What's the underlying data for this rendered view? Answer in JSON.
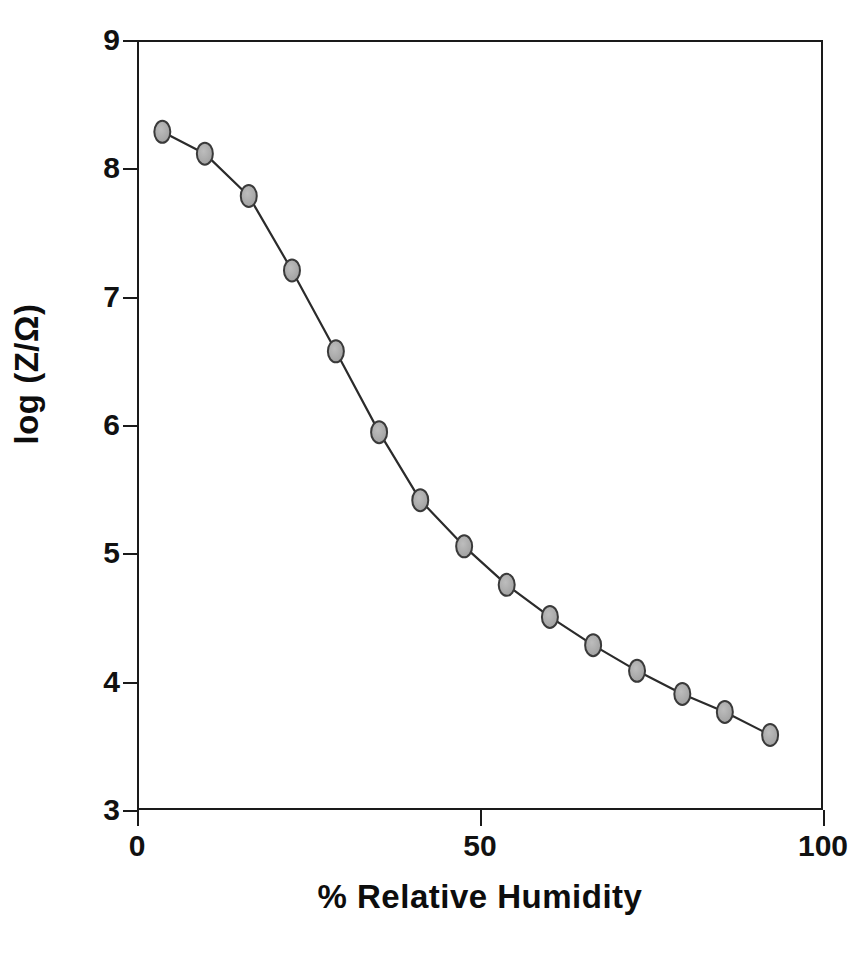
{
  "chart_data": {
    "type": "line",
    "title": "",
    "xlabel": "% Relative Humidity",
    "ylabel": "log (Z/Ω)",
    "xlim": [
      0,
      100
    ],
    "ylim": [
      3,
      9
    ],
    "xticks": [
      0,
      50,
      100
    ],
    "xtick_labels": [
      "0",
      "50",
      "100"
    ],
    "yticks": [
      3,
      4,
      5,
      6,
      7,
      8,
      9
    ],
    "ytick_labels": [
      "3",
      "4",
      "5",
      "6",
      "7",
      "8",
      "9"
    ],
    "grid": false,
    "legend": null,
    "marker": {
      "shape": "ellipse",
      "fill_color": "#a9a9a9",
      "edge_color": "#3a3a3a",
      "width_px": 16,
      "height_px": 22
    },
    "line": {
      "color": "#2b2b2b",
      "width_px": 2.2,
      "style": "solid"
    },
    "series": [
      {
        "name": "log (Z/Ω) vs % Relative Humidity",
        "x": [
          3.4,
          9.6,
          16.0,
          22.3,
          28.7,
          35.0,
          41.0,
          47.4,
          53.6,
          59.9,
          66.2,
          72.6,
          79.2,
          85.4,
          92.0
        ],
        "y": [
          8.3,
          8.13,
          7.8,
          7.22,
          6.59,
          5.96,
          5.43,
          5.07,
          4.77,
          4.52,
          4.3,
          4.1,
          3.92,
          3.78,
          3.6
        ]
      }
    ]
  }
}
